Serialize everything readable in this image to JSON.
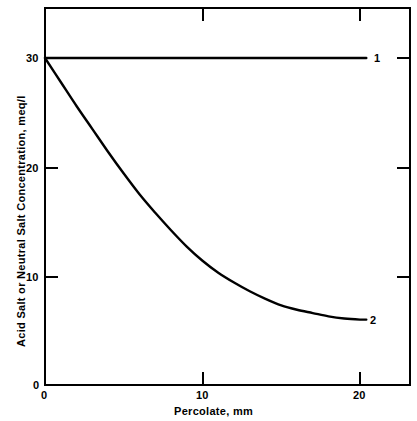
{
  "chart_data": {
    "type": "line",
    "title": "",
    "xlabel": "Percolate, mm",
    "ylabel": "Acid Salt or Neutral Salt Concentration, meq/l",
    "xlim": [
      0,
      23.2
    ],
    "ylim": [
      0,
      34.6
    ],
    "xticks": [
      0,
      10,
      20
    ],
    "xticklabels": [
      "0",
      "10",
      "20"
    ],
    "yticks": [
      0,
      10,
      20,
      30
    ],
    "yticklabels": [
      "0",
      "10",
      "20",
      "30"
    ],
    "grid": false,
    "legend_position": "inline-right-of-curve-end",
    "series": [
      {
        "name": "1",
        "label": "1",
        "annotation": "1",
        "color": "#000000",
        "x": [
          0,
          2,
          4,
          6,
          8,
          10,
          12,
          14,
          16,
          18,
          20,
          20.4
        ],
        "values": [
          30,
          30,
          30,
          30,
          30,
          30,
          30,
          30,
          30,
          30,
          30,
          30
        ]
      },
      {
        "name": "2",
        "label": "2",
        "annotation": "2",
        "color": "#000000",
        "x": [
          0,
          1,
          2,
          3,
          4,
          5,
          6,
          7,
          8,
          9,
          10,
          11,
          12,
          13,
          14,
          15,
          16,
          17,
          18,
          19,
          20,
          20.4
        ],
        "values": [
          30.0,
          27.8,
          25.6,
          23.5,
          21.4,
          19.4,
          17.5,
          15.8,
          14.2,
          12.7,
          11.4,
          10.3,
          9.4,
          8.6,
          7.9,
          7.3,
          6.9,
          6.6,
          6.3,
          6.1,
          6.0,
          6.0
        ]
      }
    ]
  },
  "axes": {
    "x_axis_label": "Percolate, mm",
    "y_axis_label": "Acid Salt or Neutral Salt Concentration, meq/l",
    "x_tick_0": "0",
    "x_tick_10": "10",
    "x_tick_20": "20",
    "y_tick_0": "0",
    "y_tick_10": "10",
    "y_tick_20": "20",
    "y_tick_30": "30"
  },
  "annotations": {
    "curve_1_label": "1",
    "curve_2_label": "2"
  },
  "colors": {
    "background": "#ffffff",
    "foreground": "#000000",
    "curve": "#000000"
  }
}
